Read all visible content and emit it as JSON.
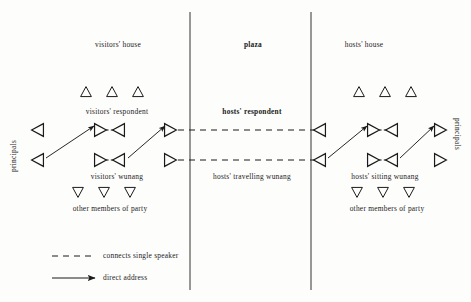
{
  "diagram": {
    "ink_color": "#1b1b1b",
    "zones": [
      {
        "id": "visitors-house",
        "label": "visitors' house",
        "bold": false,
        "x": 118,
        "y": 41
      },
      {
        "id": "plaza",
        "label": "plaza",
        "bold": true,
        "x": 253,
        "y": 41
      },
      {
        "id": "hosts-house",
        "label": "hosts' house",
        "bold": false,
        "x": 364,
        "y": 41
      }
    ],
    "dividers": [
      {
        "id": "divider-left",
        "x": 190,
        "y1": 12,
        "y2": 290
      },
      {
        "id": "divider-right",
        "x": 311,
        "y1": 12,
        "y2": 290
      }
    ],
    "side_labels": [
      {
        "id": "principals-left",
        "label": "principals",
        "x": 10,
        "y": 172
      },
      {
        "id": "principals-right",
        "label": "principals",
        "x": 461,
        "y": 118
      }
    ],
    "group_labels": [
      {
        "id": "visitors-respondent",
        "label": "visitors' respondent",
        "bold": false,
        "x": 117,
        "y": 108
      },
      {
        "id": "hosts-respondent",
        "label": "hosts' respondent",
        "bold": true,
        "x": 252,
        "y": 108
      },
      {
        "id": "visitors-wunang",
        "label": "visitors' wunang",
        "bold": false,
        "x": 117,
        "y": 173
      },
      {
        "id": "hosts-travelling-wunang",
        "label": "hosts' travelling wunang",
        "bold": false,
        "x": 252,
        "y": 173
      },
      {
        "id": "hosts-sitting-wunang",
        "label": "hosts' sitting wunang",
        "bold": false,
        "x": 385,
        "y": 173
      },
      {
        "id": "other-members-left",
        "label": "other members of party",
        "bold": false,
        "x": 110,
        "y": 205
      },
      {
        "id": "other-members-right",
        "label": "other members of party",
        "bold": false,
        "x": 387,
        "y": 205
      }
    ],
    "respondent_markers": [
      {
        "id": "v-resp-1",
        "shape": "triangle-up",
        "cx": 86,
        "cy": 92
      },
      {
        "id": "v-resp-2",
        "shape": "triangle-up",
        "cx": 112,
        "cy": 92
      },
      {
        "id": "v-resp-3",
        "shape": "triangle-up",
        "cx": 138,
        "cy": 92
      },
      {
        "id": "h-resp-1",
        "shape": "triangle-up",
        "cx": 359,
        "cy": 92
      },
      {
        "id": "h-resp-2",
        "shape": "triangle-up",
        "cx": 385,
        "cy": 92
      },
      {
        "id": "h-resp-3",
        "shape": "triangle-up",
        "cx": 411,
        "cy": 92
      }
    ],
    "party_markers": [
      {
        "id": "v-party-1",
        "shape": "triangle-down",
        "cx": 78,
        "cy": 192
      },
      {
        "id": "v-party-2",
        "shape": "triangle-down",
        "cx": 104,
        "cy": 192
      },
      {
        "id": "v-party-3",
        "shape": "triangle-down",
        "cx": 130,
        "cy": 192
      },
      {
        "id": "h-party-1",
        "shape": "triangle-down",
        "cx": 357,
        "cy": 192
      },
      {
        "id": "h-party-2",
        "shape": "triangle-down",
        "cx": 383,
        "cy": 192
      },
      {
        "id": "h-party-3",
        "shape": "triangle-down",
        "cx": 409,
        "cy": 192
      }
    ],
    "speaker_markers": [
      {
        "id": "v-principal-upper",
        "shape": "triangle-left",
        "cx": 38,
        "cy": 130
      },
      {
        "id": "v-principal-lower",
        "shape": "triangle-left",
        "cx": 38,
        "cy": 160
      },
      {
        "id": "v-respondent-speaker",
        "shape": "triangle-right",
        "cx": 100,
        "cy": 130
      },
      {
        "id": "v-respondent-listener",
        "shape": "triangle-left",
        "cx": 119,
        "cy": 130
      },
      {
        "id": "v-wunang-speaker",
        "shape": "triangle-right",
        "cx": 100,
        "cy": 160
      },
      {
        "id": "v-wunang-listener",
        "shape": "triangle-left",
        "cx": 119,
        "cy": 160
      },
      {
        "id": "v-plaza-upper",
        "shape": "triangle-right",
        "cx": 170,
        "cy": 130
      },
      {
        "id": "v-plaza-lower",
        "shape": "triangle-right",
        "cx": 170,
        "cy": 160
      },
      {
        "id": "h-plaza-upper",
        "shape": "triangle-left",
        "cx": 320,
        "cy": 130
      },
      {
        "id": "h-plaza-lower",
        "shape": "triangle-left",
        "cx": 320,
        "cy": 160
      },
      {
        "id": "h-wunang-speaker",
        "shape": "triangle-right",
        "cx": 373,
        "cy": 130
      },
      {
        "id": "h-wunang-listener",
        "shape": "triangle-left",
        "cx": 392,
        "cy": 130
      },
      {
        "id": "h-sitting-speaker",
        "shape": "triangle-right",
        "cx": 373,
        "cy": 160
      },
      {
        "id": "h-sitting-listener",
        "shape": "triangle-left",
        "cx": 392,
        "cy": 160
      },
      {
        "id": "h-principal-upper",
        "shape": "triangle-right",
        "cx": 440,
        "cy": 130
      },
      {
        "id": "h-principal-lower",
        "shape": "triangle-right",
        "cx": 440,
        "cy": 160
      }
    ],
    "dashed_pairs": [
      {
        "id": "pair-v-respondent",
        "x1": 106,
        "x2": 113,
        "y": 130
      },
      {
        "id": "pair-v-wunang",
        "x1": 106,
        "x2": 113,
        "y": 160
      },
      {
        "id": "pair-h-respondent",
        "x1": 379,
        "x2": 386,
        "y": 130
      },
      {
        "id": "pair-h-sitting",
        "x1": 379,
        "x2": 386,
        "y": 160
      }
    ],
    "dashed_links": [
      {
        "id": "link-upper-plaza",
        "x1": 178,
        "x2": 314,
        "y": 130
      },
      {
        "id": "link-lower-plaza",
        "x1": 178,
        "x2": 314,
        "y": 160
      }
    ],
    "arrows": [
      {
        "id": "arrow-v-principal-to-respondent",
        "x1": 46,
        "y1": 158,
        "x2": 94,
        "y2": 126
      },
      {
        "id": "arrow-v-wunang-to-plaza",
        "x1": 128,
        "y1": 158,
        "x2": 165,
        "y2": 126
      },
      {
        "id": "arrow-h-plaza-to-wunang",
        "x1": 328,
        "y1": 158,
        "x2": 367,
        "y2": 126
      },
      {
        "id": "arrow-h-sitting-to-principal",
        "x1": 400,
        "y1": 158,
        "x2": 434,
        "y2": 126
      }
    ],
    "legend": {
      "items": [
        {
          "id": "legend-dashed",
          "style": "dashed",
          "label": "connects single speaker",
          "sample_x1": 52,
          "sample_x2": 95,
          "y": 256
        },
        {
          "id": "legend-arrow",
          "style": "arrow",
          "label": "direct address",
          "sample_x1": 52,
          "sample_x2": 95,
          "y": 278
        }
      ],
      "label_x": 103
    }
  }
}
